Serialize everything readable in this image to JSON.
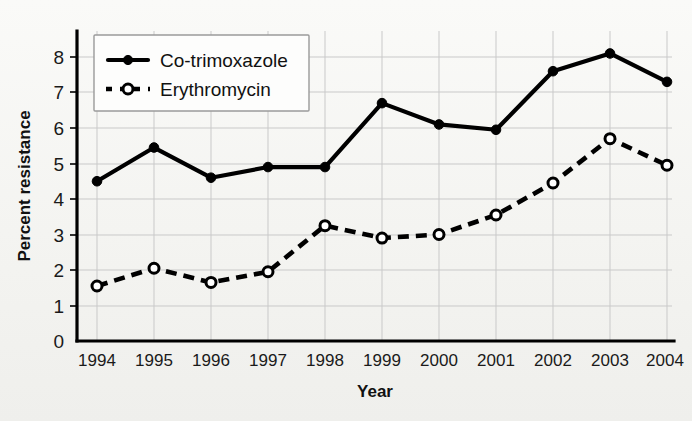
{
  "chart_data": {
    "type": "line",
    "title": "",
    "subtitle": "",
    "xlabel": "Year",
    "ylabel": "Percent resistance",
    "categories": [
      "1994",
      "1995",
      "1996",
      "1997",
      "1998",
      "1999",
      "2000",
      "2001",
      "2002",
      "2003",
      "2004"
    ],
    "x": [
      1994,
      1995,
      1996,
      1997,
      1998,
      1999,
      2000,
      2001,
      2002,
      2003,
      2004
    ],
    "ylim": [
      0,
      8.4
    ],
    "yticks": [
      0,
      1,
      2,
      3,
      4,
      5,
      6,
      7,
      8
    ],
    "ytick_labels": [
      "0",
      "1",
      "2",
      "3",
      "4",
      "5",
      "6",
      "7",
      "8"
    ],
    "grid": true,
    "grid_axis": "both",
    "legend_position": "upper-left-inside",
    "series": [
      {
        "name": "Co-trimoxazole",
        "style": "solid",
        "marker": "filled-circle",
        "color": "#000000",
        "values": [
          4.5,
          5.45,
          4.6,
          4.9,
          4.9,
          6.7,
          6.1,
          5.95,
          7.6,
          8.1,
          7.3
        ]
      },
      {
        "name": "Erythromycin",
        "style": "dashed",
        "marker": "open-circle",
        "color": "#000000",
        "values": [
          1.55,
          2.05,
          1.65,
          1.95,
          3.25,
          2.9,
          3.0,
          3.55,
          4.45,
          5.7,
          4.95
        ]
      }
    ],
    "annotations": []
  },
  "legend": {
    "entries": [
      {
        "label": "Co-trimoxazole"
      },
      {
        "label": "Erythromycin"
      }
    ]
  },
  "axes": {
    "y_title": "Percent resistance",
    "x_title": "Year"
  },
  "colors": {
    "ink": "#000000",
    "grid": "#c9c9c9",
    "paper": "#f7f7f5",
    "legend_border": "#9a9a9a"
  }
}
